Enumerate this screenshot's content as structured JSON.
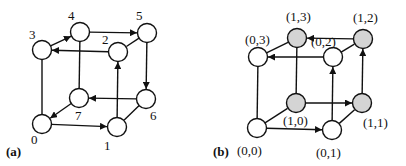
{
  "panels": [
    {
      "id": "a",
      "label": "(a)",
      "label_pos": [
        6,
        156
      ],
      "nodes": [
        {
          "id": "0",
          "label": "0",
          "x": 42,
          "y": 124,
          "fill": "#ffffff",
          "lx": 31,
          "ly": 144
        },
        {
          "id": "1",
          "label": "1",
          "x": 117,
          "y": 127,
          "fill": "#ffffff",
          "lx": 104,
          "ly": 150
        },
        {
          "id": "2",
          "label": "2",
          "x": 118,
          "y": 52,
          "fill": "#ffffff",
          "lx": 102,
          "ly": 44
        },
        {
          "id": "3",
          "label": "3",
          "x": 42,
          "y": 50,
          "fill": "#ffffff",
          "lx": 29,
          "ly": 39
        },
        {
          "id": "4",
          "label": "4",
          "x": 80,
          "y": 32,
          "fill": "#ffffff",
          "lx": 68,
          "ly": 20
        },
        {
          "id": "5",
          "label": "5",
          "x": 147,
          "y": 33,
          "fill": "#ffffff",
          "lx": 136,
          "ly": 20
        },
        {
          "id": "6",
          "label": "6",
          "x": 146,
          "y": 99,
          "fill": "#ffffff",
          "lx": 150,
          "ly": 120
        },
        {
          "id": "7",
          "label": "7",
          "x": 79,
          "y": 98,
          "fill": "#ffffff",
          "lx": 75,
          "ly": 120
        }
      ],
      "edges": [
        {
          "from": "0",
          "to": "1",
          "arrow": true
        },
        {
          "from": "1",
          "to": "2",
          "arrow": true
        },
        {
          "from": "2",
          "to": "3",
          "arrow": true
        },
        {
          "from": "3",
          "to": "4",
          "arrow": true
        },
        {
          "from": "4",
          "to": "5",
          "arrow": true
        },
        {
          "from": "5",
          "to": "6",
          "arrow": true
        },
        {
          "from": "6",
          "to": "7",
          "arrow": true
        },
        {
          "from": "7",
          "to": "0",
          "arrow": true
        },
        {
          "from": "0",
          "to": "3",
          "arrow": false
        },
        {
          "from": "4",
          "to": "7",
          "arrow": false
        },
        {
          "from": "5",
          "to": "2",
          "arrow": false
        },
        {
          "from": "6",
          "to": "1",
          "arrow": false
        }
      ]
    },
    {
      "id": "b",
      "label": "(b)",
      "label_pos": [
        213,
        156
      ],
      "nodes": [
        {
          "id": "00",
          "label": "(0,0)",
          "x": 257,
          "y": 128,
          "fill": "#ffffff",
          "lx": 237,
          "ly": 155
        },
        {
          "id": "01",
          "label": "(0,1)",
          "x": 332,
          "y": 130,
          "fill": "#ffffff",
          "lx": 316,
          "ly": 157
        },
        {
          "id": "02",
          "label": "(0,2)",
          "x": 333,
          "y": 57,
          "fill": "#ffffff",
          "lx": 311,
          "ly": 46
        },
        {
          "id": "03",
          "label": "(0,3)",
          "x": 258,
          "y": 57,
          "fill": "#ffffff",
          "lx": 245,
          "ly": 44
        },
        {
          "id": "10",
          "label": "(1,0)",
          "x": 296,
          "y": 103,
          "fill": "#d4d4d4",
          "lx": 283,
          "ly": 125
        },
        {
          "id": "11",
          "label": "(1,1)",
          "x": 362,
          "y": 103,
          "fill": "#d4d4d4",
          "lx": 363,
          "ly": 127
        },
        {
          "id": "12",
          "label": "(1,2)",
          "x": 363,
          "y": 39,
          "fill": "#d4d4d4",
          "lx": 353,
          "ly": 22
        },
        {
          "id": "13",
          "label": "(1,3)",
          "x": 297,
          "y": 38,
          "fill": "#d4d4d4",
          "lx": 286,
          "ly": 21
        }
      ],
      "edges": [
        {
          "from": "00",
          "to": "01",
          "arrow": true
        },
        {
          "from": "01",
          "to": "02",
          "arrow": true
        },
        {
          "from": "02",
          "to": "03",
          "arrow": true
        },
        {
          "from": "10",
          "to": "11",
          "arrow": true
        },
        {
          "from": "11",
          "to": "12",
          "arrow": true
        },
        {
          "from": "12",
          "to": "13",
          "arrow": true
        },
        {
          "from": "00",
          "to": "03",
          "arrow": false
        },
        {
          "from": "00",
          "to": "10",
          "arrow": false
        },
        {
          "from": "10",
          "to": "13",
          "arrow": false
        },
        {
          "from": "03",
          "to": "13",
          "arrow": false
        },
        {
          "from": "02",
          "to": "12",
          "arrow": false
        },
        {
          "from": "01",
          "to": "11",
          "arrow": false
        }
      ]
    }
  ],
  "style": {
    "node_radius": 9.5,
    "stroke": "#111111",
    "highlight_fill": "#d4d4d4"
  }
}
